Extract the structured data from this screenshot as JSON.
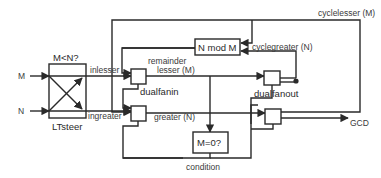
{
  "diagram": {
    "inputs": {
      "m": "M",
      "n": "N"
    },
    "output": "GCD",
    "blocks": {
      "ltsteer": {
        "title": "M<N?",
        "label": "LTsteer"
      },
      "nmodm": {
        "label": "N mod M"
      },
      "mzero": {
        "label": "M=0?"
      },
      "dualfanin": {
        "label": "dualfanin"
      },
      "dualfanout": {
        "label": "dualfanout"
      }
    },
    "signals": {
      "inlesser": "inlesser",
      "ingreater": "ingreater",
      "lesser": "lesser (M)",
      "greater": "greater (N)",
      "remainder": "remainder",
      "cyclelesser": "cyclelesser (M)",
      "cyclegreater": "cyclegreater (N)",
      "condition": "condition"
    },
    "colors": {
      "line": "#2a2a2a",
      "text": "#3a3a3a",
      "background": "#ffffff"
    }
  }
}
